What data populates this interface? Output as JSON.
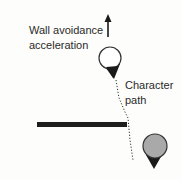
{
  "labels": {
    "wall_avoidance_line1": "Wall avoidance",
    "wall_avoidance_line2": "acceleration",
    "character_line1": "Character",
    "character_line2": "path"
  },
  "colors": {
    "wall": "#1e1e1e",
    "character_current_fill": "#ffffff",
    "character_start_fill": "#a9a9a9",
    "heading_triangle": "#1a1a1a",
    "path": "#333333",
    "text": "#2a2a2a"
  }
}
